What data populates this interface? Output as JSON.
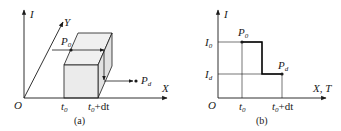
{
  "panel_a": {
    "caption": "(a)",
    "axes": {
      "vertical": "I",
      "diagonal": "Y",
      "horizontal": "X",
      "origin": "O"
    },
    "ticks": [
      {
        "base": "t",
        "sub": "0",
        "suffix": ""
      },
      {
        "base": "t",
        "sub": "0",
        "suffix": "+dt"
      }
    ],
    "points": [
      {
        "base": "P",
        "sub": "0"
      },
      {
        "base": "P",
        "sub": "d"
      }
    ],
    "colors": {
      "line": "#1a1a1a",
      "cube_fill": "#ececec"
    }
  },
  "panel_b": {
    "caption": "(b)",
    "axes": {
      "vertical": "I",
      "horizontal": "X, T",
      "origin": "O"
    },
    "y_ticks": [
      {
        "base": "I",
        "sub": "0"
      },
      {
        "base": "I",
        "sub": "d"
      }
    ],
    "x_ticks": [
      {
        "base": "t",
        "sub": "0",
        "suffix": ""
      },
      {
        "base": "t",
        "sub": "0",
        "suffix": "+dt"
      }
    ],
    "points": [
      {
        "base": "P",
        "sub": "0"
      },
      {
        "base": "P",
        "sub": "d"
      }
    ],
    "colors": {
      "line": "#1a1a1a",
      "step": "#000000"
    }
  }
}
